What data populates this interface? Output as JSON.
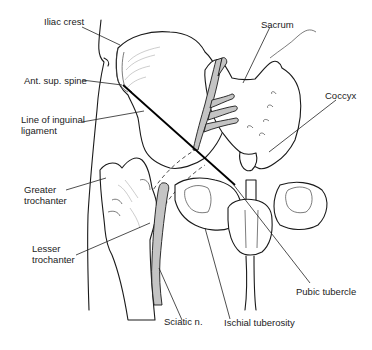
{
  "diagram": {
    "colors": {
      "line": "#1a1a1a",
      "nerve_fill": "#c4c4c4",
      "background": "#ffffff"
    },
    "labels": {
      "iliac_crest": "Iliac crest",
      "ant_sup_spine": "Ant. sup. spine",
      "inguinal_line_1": "Line of inguinal",
      "inguinal_line_2": "ligament",
      "greater_troch_1": "Greater",
      "greater_troch_2": "trochanter",
      "lesser_troch_1": "Lesser",
      "lesser_troch_2": "trochanter",
      "sciatic": "Sciatic n.",
      "ischial": "Ischial tuberosity",
      "pubic": "Pubic tubercle",
      "sacrum": "Sacrum",
      "coccyx": "Coccyx"
    }
  }
}
